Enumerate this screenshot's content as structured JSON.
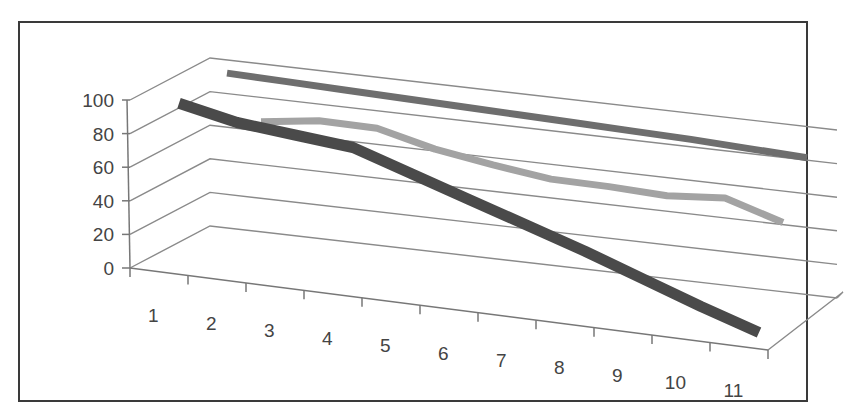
{
  "chart_data": {
    "type": "line",
    "style": "3d-line",
    "title": "",
    "xlabel": "",
    "ylabel": "",
    "ylim": [
      0,
      100
    ],
    "yticks": [
      0,
      20,
      40,
      60,
      80,
      100
    ],
    "categories": [
      "1",
      "2",
      "3",
      "4",
      "5",
      "6",
      "7",
      "8",
      "9",
      "10",
      "11"
    ],
    "grid": true,
    "legend": null,
    "series": [
      {
        "name": "Series 1",
        "color": "#6e6e6e",
        "values": [
          97,
          96.5,
          96,
          95.5,
          95,
          94.5,
          94,
          93.5,
          93,
          92,
          91
        ]
      },
      {
        "name": "Series 2",
        "color": "#a3a3a3",
        "values": [
          null,
          80,
          85,
          85,
          77,
          72,
          68,
          68,
          67,
          70,
          60
        ]
      },
      {
        "name": "Series 3",
        "color": "#4a4a4a",
        "values": [
          94,
          87,
          84,
          81,
          70,
          59,
          48,
          37,
          25,
          13,
          2
        ]
      }
    ]
  },
  "axis": {
    "y_labels": [
      "100",
      "80",
      "60",
      "40",
      "20",
      "0"
    ],
    "x_labels": [
      "1",
      "2",
      "3",
      "4",
      "5",
      "6",
      "7",
      "8",
      "9",
      "10",
      "11"
    ]
  }
}
